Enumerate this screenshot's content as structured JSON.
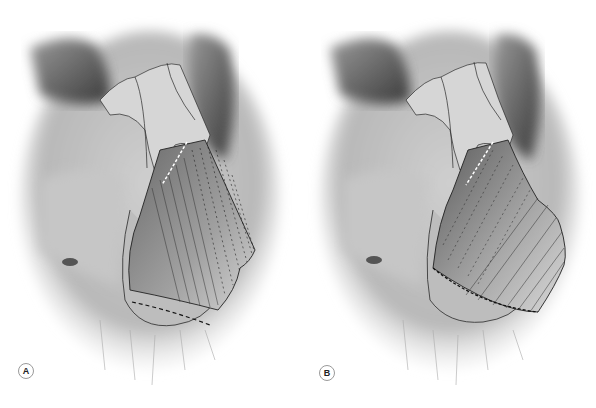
{
  "figure": {
    "type": "medical-illustration",
    "colors": {
      "background": "#ffffff",
      "bone_light": "#d8d8d8",
      "bone_mid": "#a8a8a8",
      "bone_dark": "#4a4a4a",
      "outline": "#2a2a2a",
      "graft": "#9c9c9c",
      "dash_dark": "#111111",
      "dash_light": "#ffffff"
    },
    "panels": [
      {
        "id": "A",
        "label": "A",
        "graft_style": "straight-rectangular"
      },
      {
        "id": "B",
        "label": "B",
        "graft_style": "curved-extended"
      }
    ]
  }
}
